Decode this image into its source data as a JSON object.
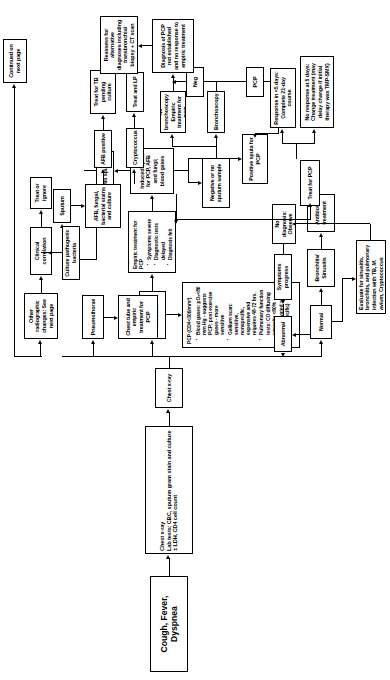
{
  "chart_title": "Cough, Fever, Dyspnea",
  "nodes": {
    "start": "Cough, Fever, Dyspnea",
    "workup": "Chest x-ray\nLab tests: CBC, sputum gram stain and culture ± LDH, CD4 cell count",
    "workup_line1": "Chest x-ray",
    "workup_line2": "Lab tests: CBC, sputum gram stain and culture ± LDH, CD4 cell count",
    "chest_xray": "Chest x-ray",
    "normal": "Normal",
    "interstitial": "Interstitial infiltrates",
    "pneumothorax": "Pneumothorax",
    "other_radiographic": "Other radiographic changes: See next page",
    "chest_tube": "Chest tube and empiric treatment for PCP",
    "clinical_correlation": "Clinical correlation",
    "treat_or_ignore": "Treat or ignore",
    "continued": "Continued on next page",
    "bronchitis": "Bronchitis/ Sinusitis",
    "antibiotic": "Antibiotic treatment",
    "pcp_criteria_title": "PCP (CD4<300/mm³)",
    "pcp_criteria": [
      "Blood gases: pO₂<80 mm Hg - suggests PCP; post exercise gases - more sensitive",
      "Gallium scan: sensitive, nonspecific, expensive and requires 48-72 hrs.",
      "Pulmonary function tests: CO diffusing capacity <80%",
      "LDH elevated >90% (non-specific)"
    ],
    "empiric_title": "Empiric treatment for PCP",
    "empiric_items": [
      "Symptoms severe",
      "Diagnostic tests delayed",
      "Diagnosis felt secure"
    ],
    "induced_sputa": "Induced sputa for PCP, AFB and fungi; blood gases",
    "no_sputum": "No sputum",
    "sputum": "Sputum",
    "afb_stains": "AFB, fungal, bacterial stains and culture",
    "culture_pathogenic": "Culture pathogenic bacteria",
    "afb_positive": "AFB positive",
    "cryptococcus": "Cryptococcus",
    "treat_tb": "Treat for TB pending culture",
    "treat_lp": "Treat and LP",
    "positive_sputa": "Positive sputa for PCP",
    "negative_no_sputum": "Negative or no sputum sample",
    "bronchoscopy": "Bronchoscopy",
    "no_bronch": "No bronchoscopy Empiric treatment for PCP",
    "neg": "Neg",
    "pcp": "PCP",
    "treat_for_pcp": "Treat for PCP",
    "dx_not_established": "Diagnosis of PCP not established and no response to empiric treatment",
    "reassess": "Reassess for alternative diagnoses including transbronchial biopsy + CT scan",
    "response_5days": "Response in <5 days: Complete 21-day course",
    "no_response_5days": "No response at 5 days: Change treatment (may delay change if initial therapy was TMP-SMX)",
    "abnormal": "Abnormal",
    "symptoms_progress": "Symptoms progress",
    "no_diagnosis": "No diagnosis: Observe",
    "evaluate_pre": "Evaluate for sinusitis, bronchitis, and pulmonary infection with TB,",
    "evaluate_italic": "M. avium,",
    "evaluate_post": " Cryptococcus"
  },
  "colors": {
    "stroke": "#000000",
    "background": "#ffffff",
    "text": "#000000"
  }
}
